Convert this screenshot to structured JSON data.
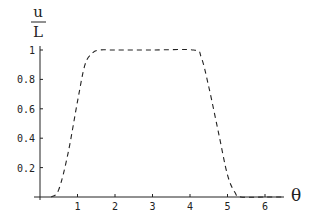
{
  "chart_data": {
    "type": "line",
    "title": "",
    "xlabel": "θ",
    "ylabel_numerator": "u",
    "ylabel_denominator": "L",
    "ylabel": "u/L",
    "xlim": [
      0,
      6.5
    ],
    "ylim": [
      0,
      1
    ],
    "grid": false,
    "legend": null,
    "x_ticks": [
      "1",
      "2",
      "3",
      "4",
      "5",
      "6"
    ],
    "y_ticks": [
      "0.2",
      "0.4",
      "0.6",
      "0.8",
      "1"
    ],
    "series": [
      {
        "name": "u/L",
        "style": "dashed",
        "color": "#222222",
        "x": [
          0.3,
          0.5,
          0.75,
          1.0,
          1.2,
          1.4,
          1.6,
          2.0,
          3.0,
          4.1,
          4.3,
          4.5,
          4.75,
          5.0,
          5.2,
          5.35,
          6.0,
          6.5
        ],
        "y": [
          0.0,
          0.05,
          0.3,
          0.65,
          0.9,
          0.98,
          1.0,
          1.0,
          1.0,
          1.0,
          0.95,
          0.75,
          0.45,
          0.15,
          0.03,
          0.0,
          0.0,
          0.0
        ]
      }
    ]
  }
}
